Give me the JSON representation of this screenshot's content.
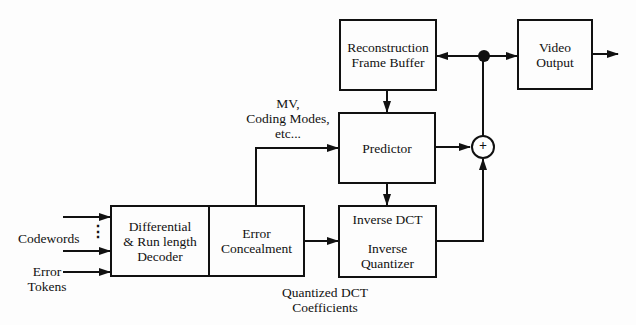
{
  "diagram": {
    "type": "block-diagram",
    "blocks": {
      "decoder": {
        "line1": "Differential",
        "line2": "& Run length",
        "line3": "Decoder"
      },
      "concealment": {
        "line1": "Error",
        "line2": "Concealment"
      },
      "recon_buffer": {
        "line1": "Reconstruction",
        "line2": "Frame Buffer"
      },
      "video_output": {
        "line1": "Video",
        "line2": "Output"
      },
      "predictor": {
        "line1": "Predictor"
      },
      "idct": {
        "line1": "Inverse DCT",
        "line2": "Inverse",
        "line3": "Quantizer"
      }
    },
    "adder_symbol": "+",
    "labels": {
      "codewords": "Codewords",
      "dots": "⋮",
      "error_tokens_1": "Error",
      "error_tokens_2": "Tokens",
      "mv_1": "MV,",
      "mv_2": "Coding Modes,",
      "mv_3": "etc...",
      "qdct_1": "Quantized DCT",
      "qdct_2": "Coefficients"
    },
    "edges": [
      {
        "from": "Codewords",
        "to": "Differential & Run length Decoder"
      },
      {
        "from": "Error Tokens",
        "to": "Differential & Run length Decoder"
      },
      {
        "from": "Differential & Run length Decoder",
        "to": "Error Concealment"
      },
      {
        "from": "Error Concealment",
        "to": "Predictor",
        "label": "MV, Coding Modes, etc..."
      },
      {
        "from": "Error Concealment",
        "to": "Inverse DCT / Inverse Quantizer",
        "label": "Quantized DCT Coefficients"
      },
      {
        "from": "Reconstruction Frame Buffer",
        "to": "Predictor"
      },
      {
        "from": "Predictor",
        "to": "Inverse DCT / Inverse Quantizer"
      },
      {
        "from": "Predictor",
        "to": "Adder"
      },
      {
        "from": "Inverse DCT / Inverse Quantizer",
        "to": "Adder"
      },
      {
        "from": "Adder",
        "to": "Junction"
      },
      {
        "from": "Junction",
        "to": "Reconstruction Frame Buffer"
      },
      {
        "from": "Junction",
        "to": "Video Output"
      },
      {
        "from": "Video Output",
        "to": "output"
      }
    ]
  }
}
